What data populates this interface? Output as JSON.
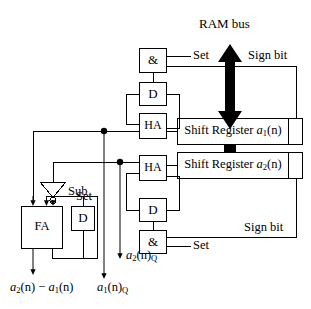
{
  "diagram": {
    "title": "RAM bus",
    "type": "digital-circuit-block-diagram",
    "background": "#ffffff",
    "line_color": "#000000",
    "bus_arrow_color": "#000000"
  },
  "labels": {
    "ram_bus": "RAM bus",
    "sign_bit_top": "Sign bit",
    "sign_bit_bottom": "Sign bit",
    "set_top": "Set",
    "set_bottom": "Set",
    "set_fa": "Set",
    "sub": "Sub"
  },
  "blocks": {
    "and_top": "&",
    "d_top": "D",
    "ha_top": "HA",
    "ha_bottom": "HA",
    "d_bottom": "D",
    "and_bottom": "&",
    "fa": "FA",
    "d_fa": "D",
    "shift_register_1_prefix": "Shift Register ",
    "shift_register_1_signal": "a",
    "shift_register_1_sub": "1",
    "shift_register_1_arg": "(n)",
    "shift_register_2_prefix": "Shift Register ",
    "shift_register_2_signal": "a",
    "shift_register_2_sub": "2",
    "shift_register_2_arg": "(n)"
  },
  "outputs": {
    "difference_a2": "a",
    "difference_a2_sub": "2",
    "difference_mid": "(n) − ",
    "difference_a1": "a",
    "difference_a1_sub": "1",
    "difference_tail": "(n)",
    "a2_q_signal": "a",
    "a2_q_sub": "2",
    "a2_q_arg": "(n)",
    "a2_q_qsub": "Q",
    "a1_q_signal": "a",
    "a1_q_sub": "1",
    "a1_q_arg": "(n)",
    "a1_q_qsub": "Q"
  }
}
